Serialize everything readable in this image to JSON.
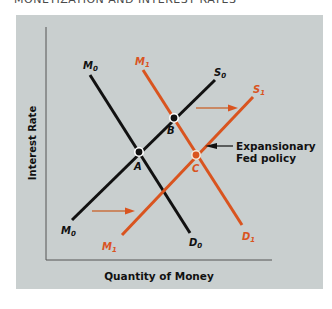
{
  "figure": {
    "title": "MONETIZATION AND INTEREST RATES",
    "x_axis_label": "Quantity of Money",
    "y_axis_label": "Interest Rate",
    "annotation": {
      "line1": "Expansionary",
      "line2": "Fed policy"
    },
    "curves": [
      {
        "id": "money-demand-0",
        "top_label": "M",
        "top_sub": "0",
        "bottom_label": "D",
        "bottom_sub": "0",
        "color": "#111111"
      },
      {
        "id": "money-supply-0",
        "top_label": "S",
        "top_sub": "0",
        "bottom_label": "M",
        "bottom_sub": "0",
        "color": "#111111"
      },
      {
        "id": "money-demand-1",
        "top_label": "M",
        "top_sub": "1",
        "bottom_label": "D",
        "bottom_sub": "1",
        "color": "#d9541f"
      },
      {
        "id": "money-supply-1",
        "top_label": "S",
        "top_sub": "1",
        "bottom_label": "M",
        "bottom_sub": "1",
        "color": "#d9541f"
      }
    ],
    "points": [
      {
        "label": "A"
      },
      {
        "label": "B"
      },
      {
        "label": "C"
      }
    ],
    "colors": {
      "background": "#c9cfcf",
      "initial_curves": "#111111",
      "shifted_curves": "#d9541f",
      "axis": "#555555"
    }
  }
}
